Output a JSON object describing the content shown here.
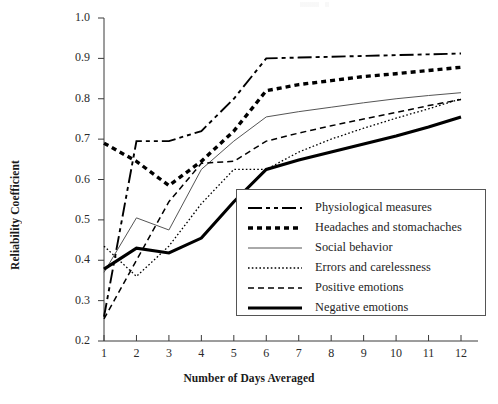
{
  "chart_data": {
    "type": "line",
    "title": "",
    "xlabel": "Number of Days Averaged",
    "ylabel": "Reliability Coefficient",
    "x": [
      1,
      2,
      3,
      4,
      5,
      6,
      7,
      8,
      9,
      10,
      11,
      12
    ],
    "xlim": [
      0.6,
      12.5
    ],
    "ylim": [
      0.2,
      1.0
    ],
    "xticks": [
      "1",
      "2",
      "3",
      "4",
      "5",
      "6",
      "7",
      "8",
      "9",
      "10",
      "11",
      "12"
    ],
    "yticks": [
      "0.2",
      "0.3",
      "0.4",
      "0.5",
      "0.6",
      "0.7",
      "0.8",
      "0.9",
      "1.0"
    ],
    "grid": false,
    "legend_position": "lower right",
    "series": [
      {
        "name": "Physiological measures",
        "style": "dash-dot",
        "width": 1.9,
        "color": "#000000",
        "values": [
          0.26,
          0.695,
          0.695,
          0.72,
          0.8,
          0.9,
          0.902,
          0.904,
          0.906,
          0.908,
          0.91,
          0.912
        ]
      },
      {
        "name": "Headaches and stomachaches",
        "style": "thick-dotted",
        "width": 3.4,
        "color": "#000000",
        "values": [
          0.69,
          0.645,
          0.585,
          0.645,
          0.72,
          0.82,
          0.835,
          0.845,
          0.855,
          0.862,
          0.87,
          0.878
        ]
      },
      {
        "name": "Social behavior",
        "style": "thin-solid",
        "width": 1.0,
        "color": "#555555",
        "values": [
          0.37,
          0.505,
          0.475,
          0.625,
          0.695,
          0.755,
          0.768,
          0.779,
          0.79,
          0.8,
          0.808,
          0.815
        ]
      },
      {
        "name": "Errors and carelessness",
        "style": "fine-dotted",
        "width": 1.3,
        "color": "#000000",
        "values": [
          0.435,
          0.36,
          0.435,
          0.54,
          0.625,
          0.625,
          0.668,
          0.7,
          0.727,
          0.752,
          0.775,
          0.8
        ]
      },
      {
        "name": "Positive emotions",
        "style": "dashed",
        "width": 1.5,
        "color": "#000000",
        "values": [
          0.255,
          0.4,
          0.545,
          0.64,
          0.645,
          0.695,
          0.715,
          0.733,
          0.75,
          0.766,
          0.783,
          0.798
        ]
      },
      {
        "name": "Negative emotions",
        "style": "thick-solid",
        "width": 3.1,
        "color": "#000000",
        "values": [
          0.378,
          0.43,
          0.418,
          0.455,
          0.545,
          0.625,
          0.648,
          0.668,
          0.688,
          0.708,
          0.73,
          0.755
        ]
      }
    ]
  },
  "axis": {
    "ytick_labels": [
      "1.0",
      "0.9",
      "0.8",
      "0.7",
      "0.6",
      "0.5",
      "0.4",
      "0.3",
      "0.2"
    ],
    "xtick_labels": [
      "1",
      "2",
      "3",
      "4",
      "5",
      "6",
      "7",
      "8",
      "9",
      "10",
      "11",
      "12"
    ]
  },
  "legend": {
    "items": [
      {
        "label": "Physiological measures",
        "style": "dash-dot"
      },
      {
        "label": "Headaches and stomachaches",
        "style": "thick-dotted"
      },
      {
        "label": "Social behavior",
        "style": "thin-solid"
      },
      {
        "label": "Errors and carelessness",
        "style": "fine-dotted"
      },
      {
        "label": "Positive emotions",
        "style": "dashed"
      },
      {
        "label": "Negative emotions",
        "style": "thick-solid"
      }
    ]
  }
}
